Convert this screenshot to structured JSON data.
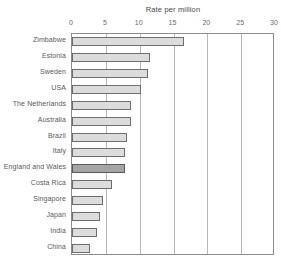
{
  "chart_data": {
    "type": "bar",
    "orientation": "horizontal",
    "title": "Rate per million",
    "xlabel": "",
    "ylabel": "",
    "xlim": [
      0,
      30
    ],
    "grid": true,
    "legend": null,
    "xticks": [
      "0",
      "5",
      "10",
      "15",
      "20",
      "25",
      "30"
    ],
    "xtick_values": [
      0,
      5,
      10,
      15,
      20,
      25,
      30
    ],
    "categories": [
      "Zimbabwe",
      "Estonia",
      "Sweden",
      "USA",
      "The Netherlands",
      "Australia",
      "Brazil",
      "Italy",
      "England and Wales",
      "Costa Rica",
      "Singapore",
      "Japan",
      "India",
      "China"
    ],
    "values": [
      16.6,
      11.6,
      11.2,
      10.2,
      8.7,
      8.7,
      8.2,
      7.9,
      7.8,
      5.9,
      4.6,
      4.1,
      3.7,
      2.6
    ],
    "highlighted_category": "England and Wales",
    "colors": {
      "bar_fill": "#dcdcdc",
      "bar_border": "#6e6e6e",
      "highlight_fill": "#a5a5a5",
      "highlight_border": "#5a5a5a",
      "gridline": "#b4b4b4",
      "axis": "#8c8c8c",
      "text": "#5a5a5a"
    }
  }
}
